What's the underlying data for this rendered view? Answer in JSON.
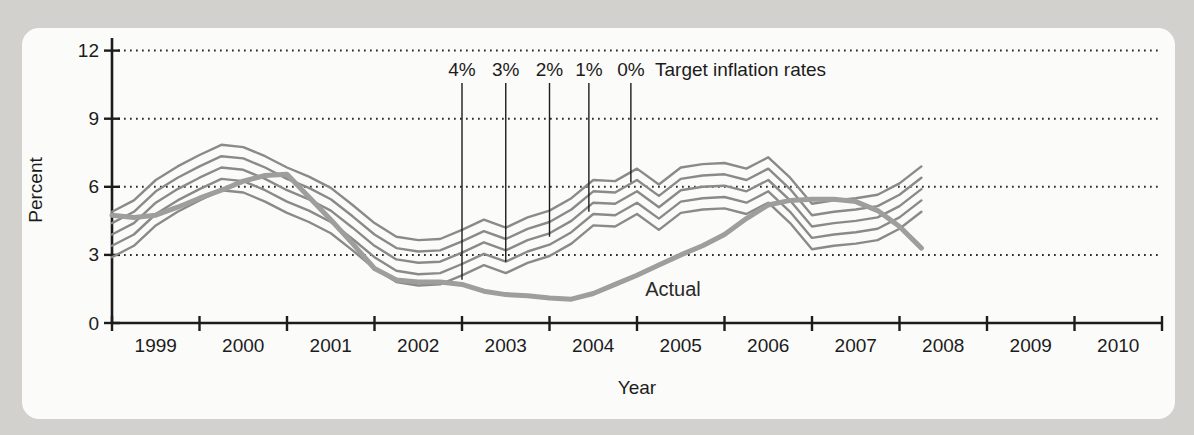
{
  "figure": {
    "background_color": "#d2d1ce",
    "card_color": "#fbfbf9",
    "axis_color": "#1c1c1c",
    "grid_dot_color": "#2a2a2a",
    "target_line_color": "#8a8a8a",
    "actual_line_color": "#9e9e9e"
  },
  "chart_data": {
    "type": "line",
    "title": "",
    "xlabel": "Year",
    "ylabel": "Percent",
    "x_range": [
      1999,
      2011
    ],
    "y_range": [
      0,
      12
    ],
    "y_ticks": [
      0,
      3,
      6,
      9,
      12
    ],
    "gridlines_at": [
      3,
      6,
      9,
      12
    ],
    "year_labels": [
      "1999",
      "2000",
      "2001",
      "2002",
      "2003",
      "2004",
      "2005",
      "2006",
      "2007",
      "2008",
      "2009",
      "2010"
    ],
    "x_quarters": [
      1999.0,
      1999.25,
      1999.5,
      1999.75,
      2000.0,
      2000.25,
      2000.5,
      2000.75,
      2001.0,
      2001.25,
      2001.5,
      2001.75,
      2002.0,
      2002.25,
      2002.5,
      2002.75,
      2003.0,
      2003.25,
      2003.5,
      2003.75,
      2004.0,
      2004.25,
      2004.5,
      2004.75,
      2005.0,
      2005.25,
      2005.5,
      2005.75,
      2006.0,
      2006.25,
      2006.5,
      2006.75,
      2007.0,
      2007.25,
      2007.5,
      2007.75,
      2008.0,
      2008.25
    ],
    "target_base_0pct": [
      4.9,
      5.4,
      6.3,
      6.9,
      7.4,
      7.85,
      7.75,
      7.35,
      6.85,
      6.45,
      5.95,
      5.2,
      4.4,
      3.8,
      3.65,
      3.7,
      4.1,
      4.55,
      4.2,
      4.65,
      4.95,
      5.5,
      6.3,
      6.25,
      6.8,
      6.1,
      6.85,
      7.0,
      7.05,
      6.8,
      7.3,
      6.4,
      5.25,
      5.4,
      5.5,
      5.65,
      6.15,
      6.9
    ],
    "target_lines": [
      {
        "label": "0%",
        "offset": 0.0
      },
      {
        "label": "1%",
        "offset": 0.5
      },
      {
        "label": "2%",
        "offset": 1.0
      },
      {
        "label": "3%",
        "offset": 1.5
      },
      {
        "label": "4%",
        "offset": 2.0
      }
    ],
    "series": [
      {
        "name": "Actual",
        "values": [
          4.75,
          4.65,
          4.75,
          5.1,
          5.5,
          5.85,
          6.25,
          6.5,
          6.55,
          5.55,
          4.55,
          3.5,
          2.4,
          1.9,
          1.8,
          1.8,
          1.7,
          1.4,
          1.25,
          1.2,
          1.1,
          1.05,
          1.3,
          1.7,
          2.1,
          2.55,
          3.0,
          3.4,
          3.9,
          4.6,
          5.2,
          5.4,
          5.45,
          5.45,
          5.35,
          4.95,
          4.25,
          3.3
        ]
      }
    ],
    "annotations": {
      "target_title": "Target inflation rates",
      "target_labels": [
        {
          "label": "4%",
          "year": 2003.0,
          "end_value": 1.9
        },
        {
          "label": "3%",
          "year": 2003.5,
          "end_value": 2.7
        },
        {
          "label": "2%",
          "year": 2004.0,
          "end_value": 3.8
        },
        {
          "label": "1%",
          "year": 2004.45,
          "end_value": 4.9
        },
        {
          "label": "0%",
          "year": 2004.93,
          "end_value": 6.2
        }
      ],
      "actual_label": {
        "text": "Actual",
        "year": 2005.35,
        "value": 1.4
      }
    }
  }
}
